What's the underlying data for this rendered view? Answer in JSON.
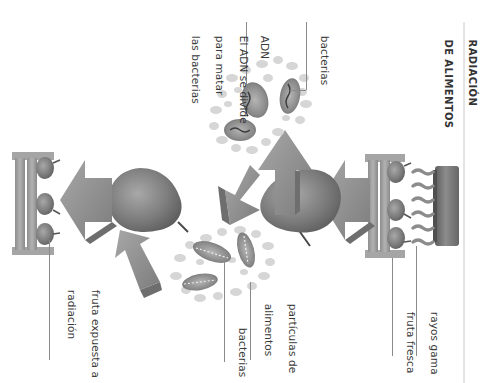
{
  "diagram": {
    "title_line1": "RADIACIÓN",
    "title_line2": "DE ALIMENTOS",
    "orientation": "rotated 90° clockwise",
    "labels": {
      "gamma_rays": "rayos gama",
      "fresh_fruit": "fruta fresca",
      "food_particles_line1": "partículas de",
      "food_particles_line2": "alimentos",
      "bacteria_bottom": "bacterias",
      "irradiated_fruit_line1": "fruta expuesta a",
      "irradiated_fruit_line2": "radiación",
      "bacteria_top": "bacterias",
      "dna": "ADN",
      "dna_note_line1": "El ADN se divide",
      "dna_note_line2": "para matar",
      "dna_note_line3": "las bacterias"
    },
    "icons": [
      "radiation-source-icon",
      "gamma-wave-icon",
      "fruit-crate-icon",
      "pear-icon",
      "arrow-icon",
      "bacteria-cluster-icon"
    ],
    "colors": {
      "background": "#ffffff",
      "text": "#3a3a3a",
      "leader_line": "#8a8a8a",
      "pear": "#7a7a7a",
      "arrow": "#8f8f8f",
      "crate": "#9a9a9a",
      "particles": "#cfcfcf",
      "bacteria": "#888888",
      "source": "#6e6e6e"
    }
  }
}
